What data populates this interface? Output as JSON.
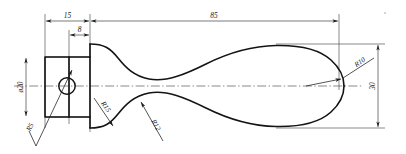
{
  "drawing": {
    "title": "Mechanical part outline drawing",
    "view": "front-view",
    "units_note": "",
    "linework": {
      "outline_color": "#141414",
      "dimension_color": "#333333",
      "background": "#ffffff"
    }
  },
  "dimensions": [
    {
      "id": "len-15",
      "label": "15",
      "kind": "linear-horizontal",
      "orientation": "horizontal"
    },
    {
      "id": "len-8",
      "label": "8",
      "kind": "linear-horizontal",
      "orientation": "horizontal"
    },
    {
      "id": "len-85",
      "label": "85",
      "kind": "linear-horizontal",
      "orientation": "horizontal"
    },
    {
      "id": "dia-20",
      "label": "ø20",
      "kind": "diameter-vertical",
      "orientation": "vertical-rotated"
    },
    {
      "id": "hgt-30",
      "label": "30",
      "kind": "linear-vertical",
      "orientation": "vertical-rotated"
    }
  ],
  "radii": [
    {
      "id": "rad-5",
      "label": "R5",
      "points_to": "hole-circle"
    },
    {
      "id": "rad-15",
      "label": "R15",
      "points_to": "lower-neck-fillet"
    },
    {
      "id": "rad-12",
      "label": "R12",
      "points_to": "lower-hump"
    },
    {
      "id": "rad-10",
      "label": "R10",
      "points_to": "right-nose-end"
    }
  ],
  "features": [
    {
      "id": "flange-block",
      "name": "left rectangular flange"
    },
    {
      "id": "hole-circle",
      "name": "through hole"
    },
    {
      "id": "body-profile",
      "name": "symmetric tapered body"
    },
    {
      "id": "centerline",
      "name": "horizontal axis centerline"
    }
  ]
}
